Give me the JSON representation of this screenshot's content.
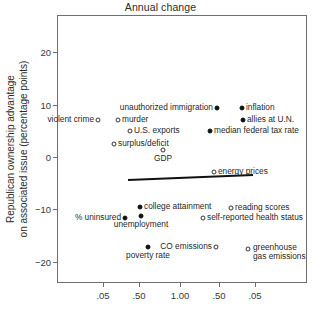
{
  "chart_data": {
    "type": "scatter",
    "title": "Annual change",
    "xlabel": "",
    "ylabel": "Republican ownership advantage\non associated issue (percentage points)",
    "ylabel_line1": "Republican ownership advantage",
    "ylabel_line2": "on associated issue (percentage points)",
    "grid": false,
    "legend": "none",
    "ylim": [
      -25.5,
      26.0
    ],
    "yticks": [
      20,
      10,
      0,
      -10,
      -20
    ],
    "ytick_labels": [
      "20",
      "10",
      "0",
      "−10",
      "−20"
    ],
    "xticks": [
      0.05,
      0.5,
      1.0,
      0.5,
      0.05
    ],
    "xtick_labels": [
      ".05",
      ".50",
      "1.00",
      ".50",
      ".05"
    ],
    "xtick_positions_px": [
      103,
      139,
      180,
      219,
      255
    ],
    "points": [
      {
        "label": "violent crime",
        "marker": "open",
        "fill": "open",
        "x_px": 98,
        "y_px": 120,
        "y_value": 6.5,
        "label_side": "left"
      },
      {
        "label": "murder",
        "marker": "open",
        "fill": "open",
        "x_px": 118,
        "y_px": 120,
        "y_value": 6.5,
        "label_side": "right"
      },
      {
        "label": "U.S. exports",
        "marker": "open",
        "fill": "open",
        "x_px": 130,
        "y_px": 131,
        "y_value": 4.4,
        "label_side": "right"
      },
      {
        "label": "surplus/deficit",
        "marker": "open",
        "fill": "open",
        "x_px": 114,
        "y_px": 144,
        "y_value": 1.9,
        "label_side": "right"
      },
      {
        "label": "GDP",
        "marker": "open",
        "fill": "open",
        "x_px": 163,
        "y_px": 150,
        "y_value": 0.7,
        "label_side": "below"
      },
      {
        "label": "unauthorized immigration",
        "marker": "filled",
        "fill": "filled",
        "x_px": 217,
        "y_px": 108,
        "y_value": 8.3,
        "label_side": "left"
      },
      {
        "label": "inflation",
        "marker": "filled",
        "fill": "filled",
        "x_px": 242,
        "y_px": 108,
        "y_value": 8.3,
        "label_side": "right"
      },
      {
        "label": "allies at U.N.",
        "marker": "filled",
        "fill": "filled",
        "x_px": 243,
        "y_px": 120,
        "y_value": 6.0,
        "label_side": "right"
      },
      {
        "label": "median federal tax rate",
        "marker": "filled",
        "fill": "filled",
        "x_px": 210,
        "y_px": 131,
        "y_value": 3.9,
        "label_side": "right"
      },
      {
        "label": "energy prices",
        "marker": "open",
        "fill": "open",
        "x_px": 214,
        "y_px": 172,
        "y_value": -3.0,
        "label_side": "right"
      },
      {
        "label": "college attainment",
        "marker": "filled",
        "fill": "filled",
        "x_px": 140,
        "y_px": 207,
        "y_value": -10.3,
        "label_side": "right"
      },
      {
        "label": "reading scores",
        "marker": "open",
        "fill": "open",
        "x_px": 231,
        "y_px": 208,
        "y_value": -10.5,
        "label_side": "right"
      },
      {
        "label": "% uninsured",
        "marker": "filled",
        "fill": "filled",
        "x_px": 125,
        "y_px": 218,
        "y_value": -12.5,
        "label_side": "left"
      },
      {
        "label": "unemployment",
        "marker": "filled",
        "fill": "filled",
        "x_px": 141,
        "y_px": 216,
        "y_value": -12.1,
        "label_side": "below"
      },
      {
        "label": "self-reported health status",
        "marker": "open",
        "fill": "open",
        "x_px": 203,
        "y_px": 218,
        "y_value": -12.5,
        "label_side": "right"
      },
      {
        "label": "poverty rate",
        "marker": "filled",
        "fill": "filled",
        "x_px": 148,
        "y_px": 247,
        "y_value": -18.3,
        "label_side": "below"
      },
      {
        "label": "CO emissions",
        "marker": "open",
        "fill": "open",
        "x_px": 216,
        "y_px": 247,
        "y_value": -18.3,
        "label_side": "left"
      },
      {
        "label": "greenhouse gas emissions",
        "marker": "open",
        "fill": "open",
        "x_px": 248,
        "y_px": 249,
        "y_value": -18.6,
        "label_side": "right-two-line"
      }
    ],
    "trend_line": {
      "x_start_px": 128,
      "y_start_px": 180,
      "x_end_px": 253,
      "y_end_px": 175,
      "y_start_value": -4.4,
      "y_end_value": -3.4,
      "color": "#111111",
      "width_px": 2.2
    }
  }
}
